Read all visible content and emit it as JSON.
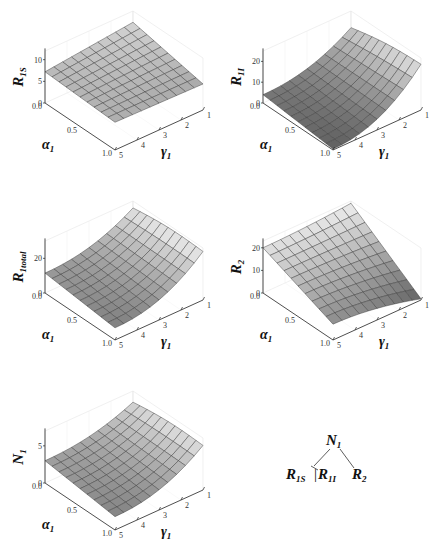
{
  "chart_data": [
    {
      "type": "surface",
      "id": "r1s",
      "zlabel": "R",
      "zlabel_sub": "1S",
      "xlabel": "α",
      "xlabel_sub": "1",
      "ylabel": "γ",
      "ylabel_sub": "1",
      "x_ticks": [
        "0.0",
        "0.5",
        "1.0"
      ],
      "y_ticks": [
        "1",
        "2",
        "3",
        "4",
        "5"
      ],
      "z_ticks": [
        "0",
        "5",
        "10"
      ],
      "zlim": [
        0,
        12
      ],
      "x_range": [
        0.0,
        1.0
      ],
      "y_range": [
        1,
        5
      ],
      "corners": {
        "a0_g5": 7.2,
        "a1_g5": 6.4,
        "a0_g1": 9.4,
        "a1_g1": 6.0
      },
      "shape": "flat"
    },
    {
      "type": "surface",
      "id": "r1i",
      "zlabel": "R",
      "zlabel_sub": "1I",
      "xlabel": "α",
      "xlabel_sub": "1",
      "ylabel": "γ",
      "ylabel_sub": "1",
      "x_ticks": [
        "0.0",
        "0.5",
        "1.0"
      ],
      "y_ticks": [
        "1",
        "2",
        "3",
        "4",
        "5"
      ],
      "z_ticks": [
        "0",
        "10",
        "20"
      ],
      "zlim": [
        0,
        25
      ],
      "x_range": [
        0.0,
        1.0
      ],
      "y_range": [
        1,
        5
      ],
      "corners": {
        "a0_g5": 4.0,
        "a1_g5": 0.5,
        "a0_g1": 17.0,
        "a1_g1": 22.0
      },
      "shape": "rise-low-gamma"
    },
    {
      "type": "surface",
      "id": "r1total",
      "zlabel": "R",
      "zlabel_sub": "1total",
      "xlabel": "α",
      "xlabel_sub": "1",
      "ylabel": "γ",
      "ylabel_sub": "1",
      "x_ticks": [
        "0.0",
        "0.5",
        "1.0"
      ],
      "y_ticks": [
        "1",
        "2",
        "3",
        "4",
        "5"
      ],
      "z_ticks": [
        "0",
        "20"
      ],
      "zlim": [
        0,
        30
      ],
      "x_range": [
        0.0,
        1.0
      ],
      "y_range": [
        1,
        5
      ],
      "corners": {
        "a0_g5": 11.5,
        "a1_g5": 7.0,
        "a0_g1": 26.0,
        "a1_g1": 28.0
      },
      "shape": "rise-low-gamma"
    },
    {
      "type": "surface",
      "id": "r2",
      "zlabel": "R",
      "zlabel_sub": "2",
      "xlabel": "α",
      "xlabel_sub": "1",
      "ylabel": "γ",
      "ylabel_sub": "1",
      "x_ticks": [
        "0.0",
        "0.5",
        "1.0"
      ],
      "y_ticks": [
        "1",
        "2",
        "3",
        "4",
        "5"
      ],
      "z_ticks": [
        "0",
        "10",
        "20"
      ],
      "zlim": [
        0,
        23
      ],
      "x_range": [
        0.0,
        1.0
      ],
      "y_range": [
        1,
        5
      ],
      "corners": {
        "a0_g5": 20.0,
        "a1_g5": 7.0,
        "a0_g1": 22.0,
        "a1_g1": 0.5
      },
      "shape": "drop-low-gamma"
    },
    {
      "type": "surface",
      "id": "n1",
      "zlabel": "N",
      "zlabel_sub": "1",
      "xlabel": "α",
      "xlabel_sub": "1",
      "ylabel": "γ",
      "ylabel_sub": "1",
      "x_ticks": [
        "0.0",
        "0.5",
        "1.0"
      ],
      "y_ticks": [
        "1",
        "2",
        "3",
        "4",
        "5"
      ],
      "z_ticks": [
        "0",
        "5"
      ],
      "zlim": [
        0,
        7
      ],
      "x_range": [
        0.0,
        1.0
      ],
      "y_range": [
        1,
        5
      ],
      "corners": {
        "a0_g5": 3.0,
        "a1_g5": 1.8,
        "a0_g1": 5.5,
        "a1_g1": 6.0
      },
      "shape": "rise-low-gamma"
    }
  ],
  "tree": {
    "root": {
      "main": "N",
      "sub": "1"
    },
    "left_a": {
      "main": "R",
      "sub": "1S"
    },
    "separator": "|",
    "left_b": {
      "main": "R",
      "sub": "1I"
    },
    "right": {
      "main": "R",
      "sub": "2"
    }
  }
}
